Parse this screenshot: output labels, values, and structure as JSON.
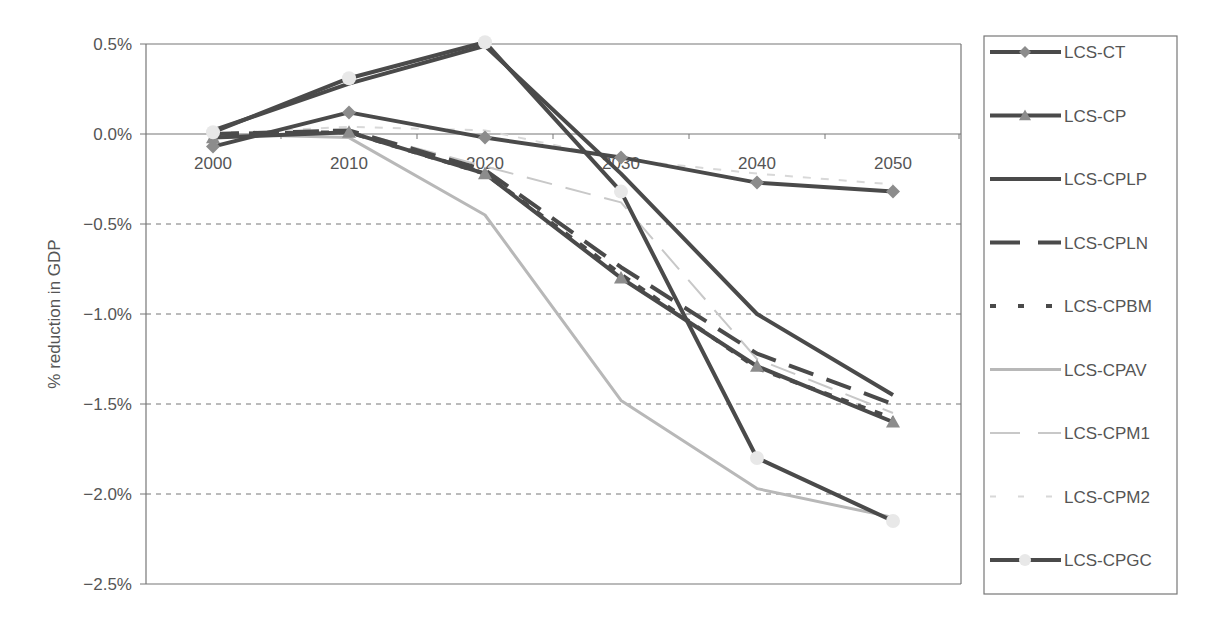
{
  "chart_data": {
    "type": "line",
    "title": "",
    "xlabel": "",
    "ylabel": "% reduction in GDP",
    "x": [
      "2000",
      "2010",
      "2020",
      "2030",
      "2040",
      "2050"
    ],
    "ylim": [
      -2.5,
      0.5
    ],
    "yticks": [
      0.5,
      0.0,
      -0.5,
      -1.0,
      -1.5,
      -2.0,
      -2.5
    ],
    "ytick_labels": [
      "0.5%",
      "0.0%",
      "−0.5%",
      "−1.0%",
      "−1.5%",
      "−2.0%",
      "−2.5%"
    ],
    "grid": "dashed horizontal at negative ticks",
    "legend_position": "right",
    "series": [
      {
        "name": "LCS-CT",
        "values": [
          -0.07,
          0.12,
          -0.02,
          -0.13,
          -0.27,
          -0.32
        ],
        "color": "#4a4a4a",
        "dash": "solid",
        "width": 4,
        "marker": "diamond",
        "marker_color": "#8c8c8c"
      },
      {
        "name": "LCS-CP",
        "values": [
          -0.02,
          0.01,
          -0.22,
          -0.8,
          -1.29,
          -1.6
        ],
        "color": "#4a4a4a",
        "dash": "solid",
        "width": 4,
        "marker": "triangle",
        "marker_color": "#8c8c8c"
      },
      {
        "name": "LCS-CPLP",
        "values": [
          0.02,
          0.28,
          0.49,
          -0.22,
          -1.0,
          -1.45
        ],
        "color": "#4a4a4a",
        "dash": "solid",
        "width": 4,
        "marker": "none"
      },
      {
        "name": "LCS-CPLN",
        "values": [
          0.0,
          0.02,
          -0.2,
          -0.74,
          -1.22,
          -1.5
        ],
        "color": "#4a4a4a",
        "dash": "long",
        "width": 4,
        "marker": "none"
      },
      {
        "name": "LCS-CPBM",
        "values": [
          0.0,
          0.01,
          -0.22,
          -0.78,
          -1.3,
          -1.58
        ],
        "color": "#4a4a4a",
        "dash": "short",
        "width": 4,
        "marker": "none"
      },
      {
        "name": "LCS-CPAV",
        "values": [
          0.0,
          -0.02,
          -0.45,
          -1.48,
          -1.97,
          -2.13
        ],
        "color": "#b8b8b8",
        "dash": "solid",
        "width": 3,
        "marker": "none"
      },
      {
        "name": "LCS-CPM1",
        "values": [
          0.0,
          0.02,
          -0.18,
          -0.38,
          -1.25,
          -1.55
        ],
        "color": "#c8c8c8",
        "dash": "long",
        "width": 2,
        "marker": "none"
      },
      {
        "name": "LCS-CPM2",
        "values": [
          0.0,
          0.04,
          0.02,
          -0.14,
          -0.22,
          -0.28
        ],
        "color": "#d8d8d8",
        "dash": "short",
        "width": 2,
        "marker": "none"
      },
      {
        "name": "LCS-CPGC",
        "values": [
          0.01,
          0.31,
          0.51,
          -0.32,
          -1.8,
          -2.15
        ],
        "color": "#4a4a4a",
        "dash": "solid",
        "width": 4,
        "marker": "circle",
        "marker_color": "#e8e8e8"
      }
    ]
  },
  "axis": {
    "y_title": "% reduction in GDP"
  },
  "legend": {
    "items": [
      {
        "label": "LCS-CT"
      },
      {
        "label": "LCS-CP"
      },
      {
        "label": "LCS-CPLP"
      },
      {
        "label": "LCS-CPLN"
      },
      {
        "label": "LCS-CPBM"
      },
      {
        "label": "LCS-CPAV"
      },
      {
        "label": "LCS-CPM1"
      },
      {
        "label": "LCS-CPM2"
      },
      {
        "label": "LCS-CPGC"
      }
    ]
  }
}
